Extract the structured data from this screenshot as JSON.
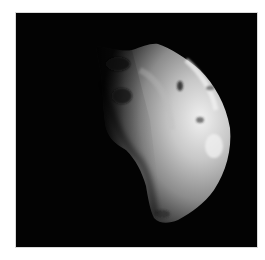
{
  "image": {
    "subject": "irregular moon in space",
    "palette": {
      "background": "#030303",
      "frame": "#ffffff",
      "highlight": "#e6e6e6",
      "midtone": "#8a8a8a",
      "shadow": "#1a1a1a"
    }
  }
}
